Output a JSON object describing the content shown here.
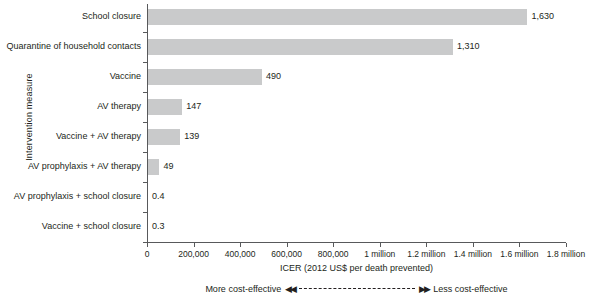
{
  "chart_data": {
    "type": "bar",
    "orientation": "horizontal",
    "title": "",
    "xlabel": "ICER (2012 US$ per death prevented)",
    "ylabel": "Intervention measure",
    "categories": [
      "School closure",
      "Quarantine of household contacts",
      "Vaccine",
      "AV therapy",
      "Vaccine + AV therapy",
      "AV prophylaxis + AV therapy",
      "AV prophylaxis + school closure",
      "Vaccine + school closure"
    ],
    "values": [
      1630000,
      1310000,
      490000,
      147000,
      139000,
      49000,
      400,
      300
    ],
    "value_labels": [
      "1,630",
      "1,310",
      "490",
      "147",
      "139",
      "49",
      "0.4",
      "0.3"
    ],
    "value_label_units": "thousands of 2012 US$",
    "xlim": [
      0,
      1800000
    ],
    "xticks": [
      0,
      200000,
      400000,
      600000,
      800000,
      1000000,
      1200000,
      1400000,
      1600000,
      1800000
    ],
    "xtick_labels": [
      "0",
      "200,000",
      "400,000",
      "600,000",
      "800,000",
      "1 million",
      "1.2 million",
      "1.4 million",
      "1.6 million",
      "1.8 million"
    ],
    "grid": false,
    "legend": "none",
    "bar_color": "#c9cacb",
    "axis_color": "#58595b",
    "text_color": "#231f20"
  },
  "footer": {
    "more_label": "More cost-effective",
    "less_label": "Less cost-effective",
    "left_arrow": "◀◀",
    "right_arrow": "▶▶"
  }
}
